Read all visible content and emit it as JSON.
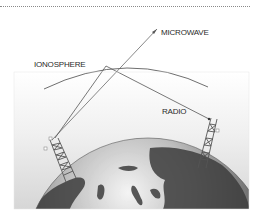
{
  "figure": {
    "labels": {
      "microwave": "MICROWAVE",
      "ionosphere": "IONOSPHERE",
      "radio": "RADIO"
    },
    "elements": {
      "ionosphere_arc": "ionosphere-arc",
      "earth": "globe",
      "left_tower": "transmitter-tower",
      "right_tower": "receiver-tower",
      "microwave_path": "microwave-ray",
      "radio_path": "radio-ray-reflected"
    },
    "colors": {
      "background_top": "#ffffff",
      "background_bottom": "#d9d9d9",
      "line": "#555555",
      "earth_dark": "#3a3a3a",
      "earth_light": "#e8e8e8",
      "rule": "#8a8a8a"
    }
  }
}
